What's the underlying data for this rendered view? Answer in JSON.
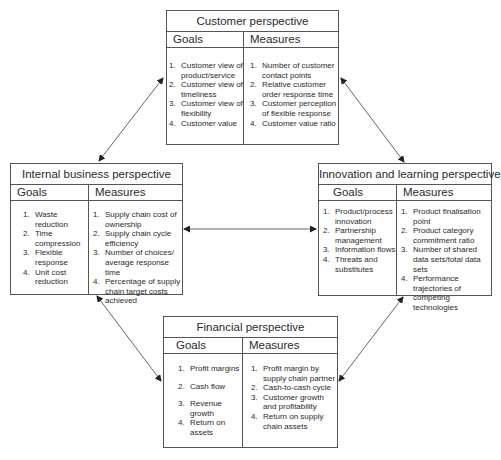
{
  "diagram": {
    "type": "balanced-scorecard",
    "line_color": "#555555",
    "arrows": [
      {
        "from": "customer",
        "to": "internal",
        "bidirectional": true
      },
      {
        "from": "customer",
        "to": "innovation",
        "bidirectional": true
      },
      {
        "from": "internal",
        "to": "innovation",
        "bidirectional": true
      },
      {
        "from": "internal",
        "to": "financial",
        "bidirectional": true
      },
      {
        "from": "innovation",
        "to": "financial",
        "bidirectional": true
      }
    ]
  },
  "customer": {
    "title": "Customer perspective",
    "goals_label": "Goals",
    "measures_label": "Measures",
    "goals": [
      {
        "n": "1.",
        "text": "Customer view of product/service"
      },
      {
        "n": "2.",
        "text": "Customer view of timeliness"
      },
      {
        "n": "3.",
        "text": "Customer view of flexibility"
      },
      {
        "n": "4.",
        "text": "Customer value"
      }
    ],
    "measures": [
      {
        "n": "1.",
        "text": "Number of customer contact points"
      },
      {
        "n": "2.",
        "text": "Relative customer order response time"
      },
      {
        "n": "3.",
        "text": "Customer perception of flexible response"
      },
      {
        "n": "4.",
        "text": "Customer value ratio"
      }
    ]
  },
  "internal": {
    "title": "Internal business perspective",
    "goals_label": "Goals",
    "measures_label": "Measures",
    "goals": [
      {
        "n": "1.",
        "text": "Waste reduction"
      },
      {
        "n": "2.",
        "text": "Time compression"
      },
      {
        "n": "3.",
        "text": "Flexible response"
      },
      {
        "n": "4.",
        "text": "Unit cost reduction"
      }
    ],
    "measures": [
      {
        "n": "1.",
        "text": "Supply chain cost of ownership"
      },
      {
        "n": "2.",
        "text": "Supply chain cycle efficiency"
      },
      {
        "n": "3.",
        "text": "Number of choices/ average response time"
      },
      {
        "n": "4.",
        "text": "Percentage of supply chain target costs achieved"
      }
    ]
  },
  "innovation": {
    "title": "Innovation and learning perspective",
    "goals_label": "Goals",
    "measures_label": "Measures",
    "goals": [
      {
        "n": "1.",
        "text": "Product/process innovation"
      },
      {
        "n": "2.",
        "text": "Partnership management"
      },
      {
        "n": "3.",
        "text": "Information flows"
      },
      {
        "n": "4.",
        "text": "Threats and substitutes"
      }
    ],
    "measures": [
      {
        "n": "1.",
        "text": "Product finalisation point"
      },
      {
        "n": "2.",
        "text": "Product category commitment ratio"
      },
      {
        "n": "3.",
        "text": "Number of shared data sets/total data sets"
      },
      {
        "n": "4.",
        "text": "Performance trajectories of competing technologies"
      }
    ]
  },
  "financial": {
    "title": "Financial perspective",
    "goals_label": "Goals",
    "measures_label": "Measures",
    "goals": [
      {
        "n": "1.",
        "text": "Profit margins"
      },
      {
        "n": "2.",
        "text": "Cash flow"
      },
      {
        "n": "3.",
        "text": "Revenue growth"
      },
      {
        "n": "4.",
        "text": "Return on assets"
      }
    ],
    "measures": [
      {
        "n": "1.",
        "text": "Profit margin by supply chain partner"
      },
      {
        "n": "2.",
        "text": "Cash-to-cash cycle"
      },
      {
        "n": "3.",
        "text": "Customer growth and profitability"
      },
      {
        "n": "4.",
        "text": "Return on supply chain assets"
      }
    ]
  }
}
